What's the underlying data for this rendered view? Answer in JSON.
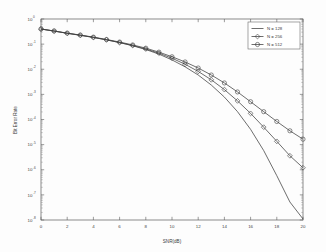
{
  "figure": {
    "background_color": "#fdfdfd",
    "axes_color": "#5a5a5a",
    "curve_color": "#3d3d3d"
  },
  "chart_data": {
    "type": "line",
    "title": "",
    "xlabel": "SNR(dB)",
    "ylabel": "Bit Error Rate",
    "xlim": [
      0,
      20
    ],
    "ylim": [
      1e-08,
      1
    ],
    "yscale": "log",
    "xscale": "linear",
    "grid": false,
    "legend_position": "upper right",
    "xticks": [
      0,
      2,
      4,
      6,
      8,
      10,
      12,
      14,
      16,
      18,
      20
    ],
    "xticklabels": [
      "0",
      "2",
      "4",
      "6",
      "8",
      "10",
      "12",
      "14",
      "16",
      "18",
      "20"
    ],
    "yticks": [
      1,
      0.1,
      0.01,
      0.001,
      0.0001,
      1e-05,
      1e-06,
      1e-07,
      1e-08
    ],
    "yticklabels": [
      {
        "base": "10",
        "exp": "0"
      },
      {
        "base": "10",
        "exp": "-1"
      },
      {
        "base": "10",
        "exp": "-2"
      },
      {
        "base": "10",
        "exp": "-3"
      },
      {
        "base": "10",
        "exp": "-4"
      },
      {
        "base": "10",
        "exp": "-5"
      },
      {
        "base": "10",
        "exp": "-6"
      },
      {
        "base": "10",
        "exp": "-7"
      },
      {
        "base": "10",
        "exp": "-8"
      }
    ],
    "x": [
      0,
      1,
      2,
      3,
      4,
      5,
      6,
      7,
      8,
      9,
      10,
      11,
      12,
      13,
      14,
      15,
      16,
      17,
      18,
      19,
      20
    ],
    "series": [
      {
        "name": "N = 128",
        "marker": "none",
        "values": [
          0.4,
          0.33,
          0.27,
          0.225,
          0.185,
          0.148,
          0.115,
          0.086,
          0.061,
          0.04,
          0.0235,
          0.0125,
          0.0059,
          0.00235,
          0.00078,
          0.000205,
          4.05e-05,
          5.8e-06,
          5.8e-07,
          5.2e-08,
          1.1e-08
        ]
      },
      {
        "name": "N = 256",
        "marker": "diamond",
        "values": [
          0.4,
          0.33,
          0.27,
          0.225,
          0.185,
          0.148,
          0.116,
          0.088,
          0.064,
          0.0435,
          0.0275,
          0.0158,
          0.0082,
          0.0038,
          0.00155,
          0.00055,
          0.000175,
          4.95e-05,
          1.35e-05,
          3.6e-06,
          1.2e-06
        ]
      },
      {
        "name": "N = 512",
        "marker": "circle",
        "values": [
          0.4,
          0.335,
          0.275,
          0.23,
          0.19,
          0.153,
          0.121,
          0.093,
          0.069,
          0.048,
          0.0315,
          0.0195,
          0.0112,
          0.0059,
          0.00285,
          0.00125,
          0.00051,
          0.000205,
          8.35e-05,
          3.55e-05,
          1.65e-05
        ]
      }
    ]
  },
  "legend": {
    "entries": [
      "N = 128",
      "N = 256",
      "N = 512"
    ]
  }
}
